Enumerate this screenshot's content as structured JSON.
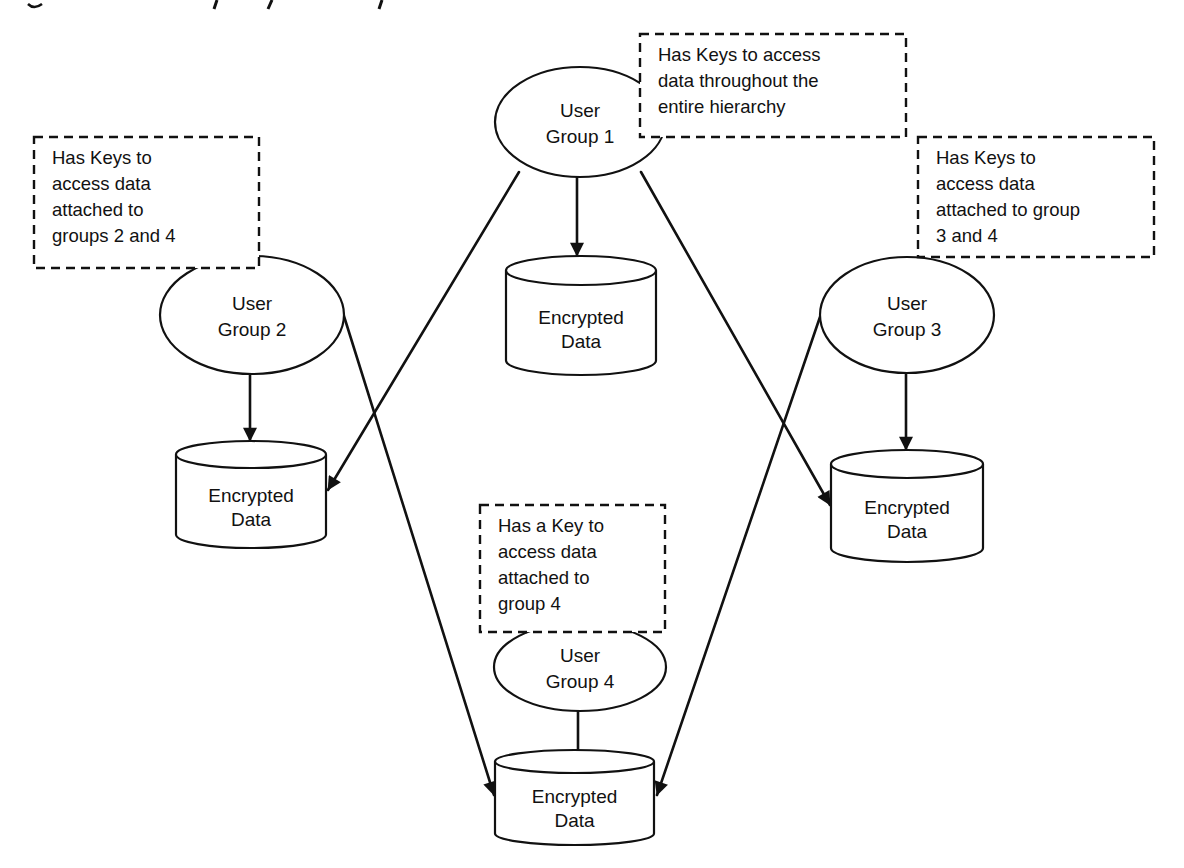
{
  "diagram": {
    "stroke_color": "#111111",
    "background": "#ffffff",
    "user_groups": [
      {
        "id": "g1",
        "lines": [
          "User",
          "Group 1"
        ],
        "cx": 580,
        "cy": 122,
        "rx": 85,
        "ry": 55
      },
      {
        "id": "g2",
        "lines": [
          "User",
          "Group 2"
        ],
        "cx": 252,
        "cy": 315,
        "rx": 92,
        "ry": 59
      },
      {
        "id": "g3",
        "lines": [
          "User",
          "Group 3"
        ],
        "cx": 907,
        "cy": 315,
        "rx": 87,
        "ry": 58
      },
      {
        "id": "g4",
        "lines": [
          "User",
          "Group 4"
        ],
        "cx": 580,
        "cy": 667,
        "rx": 86,
        "ry": 44
      }
    ],
    "data_stores": [
      {
        "id": "d1",
        "lines": [
          "Encrypted",
          "Data"
        ],
        "x": 506,
        "top": 256,
        "width": 150,
        "cap": 29,
        "bottom": 375
      },
      {
        "id": "d2",
        "lines": [
          "Encrypted",
          "Data"
        ],
        "x": 176,
        "top": 441,
        "width": 150,
        "cap": 27,
        "bottom": 548
      },
      {
        "id": "d3",
        "lines": [
          "Encrypted",
          "Data"
        ],
        "x": 831,
        "top": 450,
        "width": 152,
        "cap": 28,
        "bottom": 562
      },
      {
        "id": "d4",
        "lines": [
          "Encrypted",
          "Data"
        ],
        "x": 495,
        "top": 750,
        "width": 159,
        "cap": 23,
        "bottom": 845
      }
    ],
    "notes": [
      {
        "id": "n1",
        "lines": [
          "Has Keys to access",
          "data throughout the",
          "entire hierarchy"
        ],
        "x": 640,
        "y": 34,
        "width": 266,
        "height": 103
      },
      {
        "id": "n2",
        "lines": [
          "Has Keys to",
          "access data",
          "attached to",
          "groups 2 and 4"
        ],
        "x": 34,
        "y": 137,
        "width": 225,
        "height": 131
      },
      {
        "id": "n3",
        "lines": [
          "Has Keys to",
          "access data",
          "attached to group",
          "3 and 4"
        ],
        "x": 918,
        "y": 137,
        "width": 236,
        "height": 120
      },
      {
        "id": "n4",
        "lines": [
          "Has a Key to",
          "access data",
          "attached to",
          "group 4"
        ],
        "x": 480,
        "y": 505,
        "width": 185,
        "height": 127
      }
    ],
    "connectors": [
      {
        "id": "e1",
        "from": "g1",
        "to": "d1",
        "x1": 577,
        "y1": 177,
        "x2": 577,
        "y2": 256,
        "arrow": true
      },
      {
        "id": "e2",
        "from": "g1",
        "to": "d2",
        "x1": 519,
        "y1": 172,
        "x2": 328,
        "y2": 490,
        "arrow": true
      },
      {
        "id": "e3",
        "from": "g1",
        "to": "d3",
        "x1": 641,
        "y1": 172,
        "x2": 830,
        "y2": 505,
        "arrow": true
      },
      {
        "id": "e4",
        "from": "g2",
        "to": "d2",
        "x1": 250,
        "y1": 374,
        "x2": 250,
        "y2": 441,
        "arrow": true
      },
      {
        "id": "e5",
        "from": "g2",
        "to": "d4",
        "x1": 343,
        "y1": 313,
        "x2": 494,
        "y2": 795,
        "arrow": true
      },
      {
        "id": "e6",
        "from": "g3",
        "to": "d3",
        "x1": 906,
        "y1": 373,
        "x2": 906,
        "y2": 450,
        "arrow": true
      },
      {
        "id": "e7",
        "from": "g3",
        "to": "d4",
        "x1": 821,
        "y1": 314,
        "x2": 657,
        "y2": 795,
        "arrow": true
      },
      {
        "id": "e8",
        "from": "g4",
        "to": "d4",
        "x1": 578,
        "y1": 711,
        "x2": 578,
        "y2": 752,
        "arrow": false
      }
    ]
  }
}
